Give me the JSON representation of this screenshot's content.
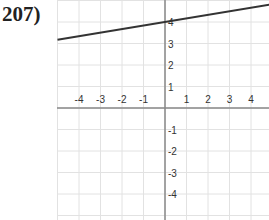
{
  "problem": {
    "number_label": "207)"
  },
  "chart_data": {
    "type": "line",
    "title": "",
    "xlabel": "",
    "ylabel": "",
    "xlim": [
      -5,
      5
    ],
    "ylim": [
      -5,
      5
    ],
    "grid": true,
    "x_tick_labels": [
      "-4",
      "-3",
      "-2",
      "-1",
      "1",
      "2",
      "3",
      "4"
    ],
    "y_tick_labels": [
      "4",
      "3",
      "2",
      "1",
      "-1",
      "-2",
      "-3",
      "-4"
    ],
    "series": [
      {
        "name": "line",
        "x": [
          -5,
          5
        ],
        "y": [
          3.17,
          4.83
        ],
        "y_intercept": 4,
        "slope_approx": 0.1667,
        "color": "#333333"
      }
    ]
  }
}
